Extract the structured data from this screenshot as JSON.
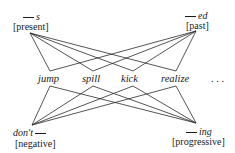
{
  "affixes": {
    "present": {
      "form": "s",
      "label": "[present]"
    },
    "past": {
      "form": "ed",
      "label": "[past]"
    },
    "negative": {
      "form": "don't",
      "label": "[negative]"
    },
    "progressive": {
      "form": "ing",
      "label": "[progressive]"
    }
  },
  "stems": [
    "jump",
    "spill",
    "kick",
    "realize"
  ],
  "ellipsis": ". . .",
  "colors": {
    "line": "#2a2a2a",
    "text": "#1a1a1a"
  }
}
